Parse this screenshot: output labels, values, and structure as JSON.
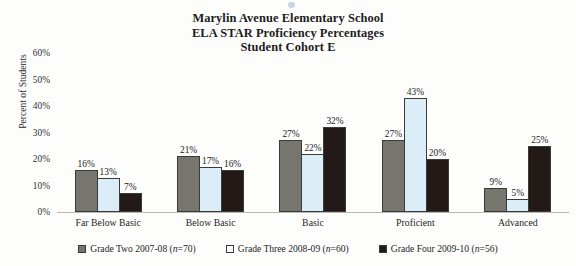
{
  "chart_data": {
    "type": "bar",
    "title": "Marylin Avenue Elementary School ELA STAR Proficiency Percentages Student Cohort E",
    "title_lines": [
      "Marylin Avenue Elementary School",
      "ELA STAR Proficiency Percentages",
      "Student Cohort E"
    ],
    "xlabel": "",
    "ylabel": "Percent of Students",
    "ylim": [
      0,
      60
    ],
    "ytick_labels": [
      "0%",
      "10%",
      "20%",
      "30%",
      "40%",
      "50%",
      "60%"
    ],
    "ytick_values": [
      0,
      10,
      20,
      30,
      40,
      50,
      60
    ],
    "grid": false,
    "legend_position": "bottom",
    "categories": [
      "Far Below Basic",
      "Below Basic",
      "Basic",
      "Proficient",
      "Advanced"
    ],
    "series": [
      {
        "name": "Grade Two 2007-08 (n=70)",
        "name_prefix": "Grade Two 2007-08 (",
        "name_italic": "n",
        "name_suffix": "=70)",
        "color": "#76766f",
        "values": [
          16,
          21,
          27,
          27,
          9
        ],
        "labels": [
          "16%",
          "21%",
          "27%",
          "27%",
          "9%"
        ]
      },
      {
        "name": "Grade Three 2008-09 (n=60)",
        "name_prefix": "Grade Three 2008-09 (",
        "name_italic": "n",
        "name_suffix": "=60)",
        "color": "#dbedf6",
        "values": [
          13,
          17,
          22,
          43,
          5
        ],
        "labels": [
          "13%",
          "17%",
          "22%",
          "43%",
          "5%"
        ]
      },
      {
        "name": "Grade Four 2009-10 (n=56)",
        "name_prefix": "Grade Four 2009-10 (",
        "name_italic": "n",
        "name_suffix": "=56)",
        "color": "#231a17",
        "values": [
          7,
          16,
          32,
          20,
          25
        ],
        "labels": [
          "7%",
          "16%",
          "32%",
          "20%",
          "25%"
        ]
      }
    ]
  }
}
